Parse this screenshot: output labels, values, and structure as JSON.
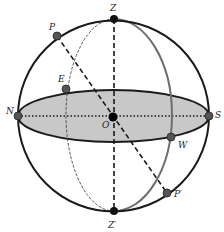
{
  "diagram": {
    "type": "celestial-sphere",
    "colors": {
      "sphere_outline": "#1a1a1a",
      "horizon_fill": "#c8c8c8",
      "meridian_gray": "#6e6e6e",
      "point_fill": "#555555",
      "center_fill": "#000000"
    },
    "labels": {
      "Z": "Z",
      "Z_prime": "Z′",
      "N": "N",
      "S": "S",
      "E": "E",
      "W": "W",
      "O": "O",
      "P": "P",
      "P_prime": "P′"
    },
    "points": [
      {
        "id": "Z",
        "x": 114,
        "y": 19
      },
      {
        "id": "Z_prime",
        "x": 114,
        "y": 211
      },
      {
        "id": "N",
        "x": 18,
        "y": 116
      },
      {
        "id": "S",
        "x": 209,
        "y": 116
      },
      {
        "id": "E",
        "x": 66,
        "y": 89
      },
      {
        "id": "W",
        "x": 171,
        "y": 137
      },
      {
        "id": "O",
        "x": 113,
        "y": 117
      },
      {
        "id": "P",
        "x": 57,
        "y": 36
      },
      {
        "id": "P_prime",
        "x": 167,
        "y": 193
      }
    ]
  }
}
